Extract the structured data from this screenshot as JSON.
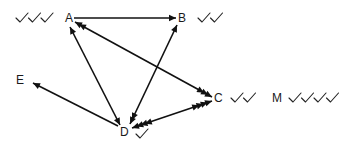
{
  "diagram": {
    "nodes": [
      {
        "id": "A",
        "label": "A",
        "x": 65,
        "y": 22,
        "checks": 3,
        "check_side": "left",
        "check_x": 16,
        "check_y": 14
      },
      {
        "id": "B",
        "label": "B",
        "x": 178,
        "y": 22,
        "checks": 2,
        "check_side": "right",
        "check_x": 198,
        "check_y": 14
      },
      {
        "id": "C",
        "label": "C",
        "x": 214,
        "y": 102,
        "checks": 2,
        "check_side": "right",
        "check_x": 231,
        "check_y": 94
      },
      {
        "id": "M",
        "label": "M",
        "x": 272,
        "y": 102,
        "checks": 4,
        "check_side": "right",
        "check_x": 289,
        "check_y": 94
      },
      {
        "id": "D",
        "label": "D",
        "x": 120,
        "y": 136,
        "checks": 1,
        "check_side": "right",
        "check_x": 136,
        "check_y": 130
      },
      {
        "id": "E",
        "label": "E",
        "x": 16,
        "y": 84,
        "checks": 0
      }
    ],
    "edges": [
      {
        "from": "A",
        "to": "B",
        "x1": 74,
        "y1": 18,
        "x2": 176,
        "y2": 18,
        "heads_start": 0,
        "heads_end": 1
      },
      {
        "from": "A",
        "to": "C",
        "x1": 75,
        "y1": 22,
        "x2": 212,
        "y2": 97,
        "heads_start": 2,
        "heads_end": 3
      },
      {
        "from": "A",
        "to": "D",
        "x1": 70,
        "y1": 27,
        "x2": 120,
        "y2": 125,
        "heads_start": 1,
        "heads_end": 1
      },
      {
        "from": "B",
        "to": "D",
        "x1": 177,
        "y1": 25,
        "x2": 130,
        "y2": 124,
        "heads_start": 1,
        "heads_end": 2
      },
      {
        "from": "D",
        "to": "C",
        "x1": 132,
        "y1": 128,
        "x2": 212,
        "y2": 101,
        "heads_start": 4,
        "heads_end": 4
      },
      {
        "from": "D",
        "to": "E",
        "x1": 118,
        "y1": 126,
        "x2": 33,
        "y2": 83,
        "heads_start": 0,
        "heads_end": 1
      }
    ]
  }
}
